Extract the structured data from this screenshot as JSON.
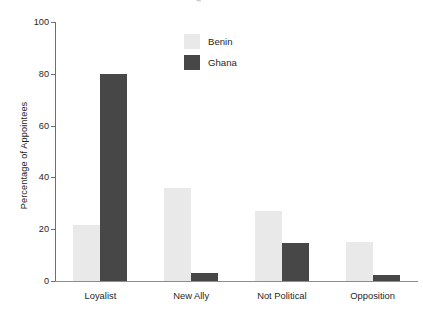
{
  "figure": {
    "title_artifact": "g",
    "background": "#ffffff"
  },
  "chart_data": {
    "type": "bar",
    "title": "",
    "xlabel": "",
    "ylabel": "Percentage of Appointees",
    "categories": [
      "Loyalist",
      "New Ally",
      "Not Political",
      "Opposition"
    ],
    "series": [
      {
        "name": "Benin",
        "color": "#e9e9e9",
        "values": [
          21.5,
          36,
          27,
          15
        ]
      },
      {
        "name": "Ghana",
        "color": "#474747",
        "values": [
          80,
          3,
          14.5,
          2.5
        ]
      }
    ],
    "ylim": [
      0,
      100
    ],
    "yticks": [
      0,
      20,
      40,
      60,
      80,
      100
    ],
    "ytick_labels": [
      "0",
      "20",
      "40",
      "60",
      "80",
      "100"
    ],
    "grid": false,
    "legend_position": "upper center",
    "legend_entries": [
      "Benin",
      "Ghana"
    ]
  }
}
